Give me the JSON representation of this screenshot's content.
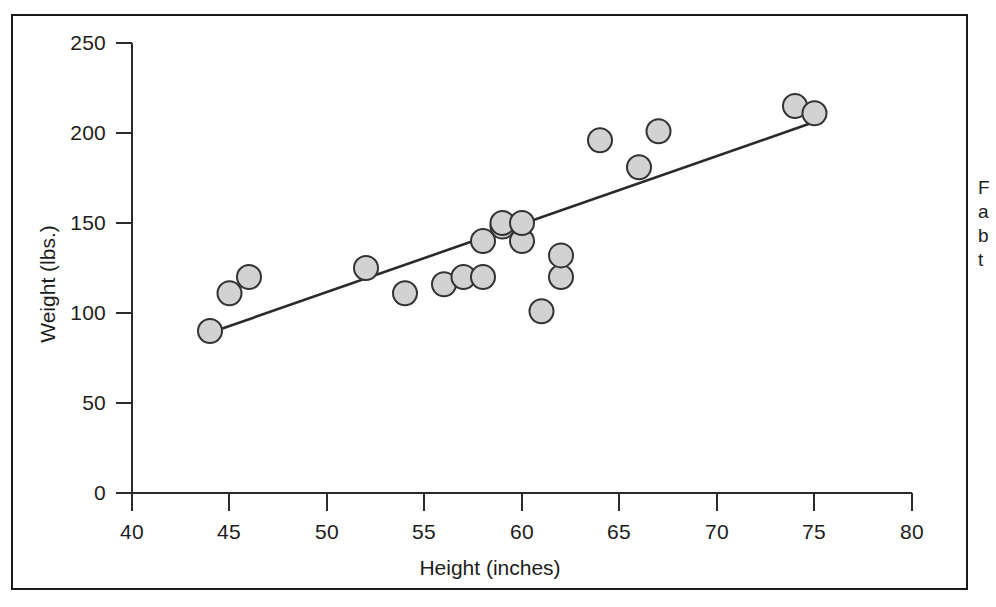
{
  "figure": {
    "background_color": "#ffffff",
    "frame_color": "#1a1a1a",
    "marker_fill": "#d2d2d2",
    "marker_stroke": "#333333",
    "trend_line_color": "#2a2a2a"
  },
  "side_caption": {
    "line1": "F",
    "line2": "a",
    "line3": "b",
    "line4": "t"
  },
  "chart_data": {
    "type": "scatter",
    "title": "",
    "xlabel": "Height (inches)",
    "ylabel": "Weight (lbs.)",
    "xlim": [
      40,
      80
    ],
    "ylim": [
      0,
      250
    ],
    "xticks": [
      40,
      45,
      50,
      55,
      60,
      65,
      70,
      75,
      80
    ],
    "yticks": [
      0,
      50,
      100,
      150,
      200,
      250
    ],
    "grid": false,
    "legend": null,
    "series": [
      {
        "name": "Observations",
        "marker": "circle",
        "x": [
          44,
          45,
          46,
          52,
          54,
          56,
          57,
          58,
          58,
          59,
          59,
          60,
          60,
          61,
          62,
          62,
          64,
          66,
          67,
          74,
          75
        ],
        "y": [
          90,
          111,
          120,
          125,
          111,
          116,
          120,
          120,
          140,
          148,
          150,
          140,
          150,
          101,
          120,
          132,
          196,
          181,
          201,
          215,
          211
        ]
      }
    ],
    "trend_line": {
      "name": "Least-squares fit",
      "x_start": 44,
      "y_start": 89,
      "x_end": 75.5,
      "y_end": 208
    }
  },
  "axes": {
    "x_tick_labels": [
      "40",
      "45",
      "50",
      "55",
      "60",
      "65",
      "70",
      "75",
      "80"
    ],
    "y_tick_labels": [
      "0",
      "50",
      "100",
      "150",
      "200",
      "250"
    ],
    "x_title": "Height (inches)",
    "y_title": "Weight (lbs.)"
  }
}
